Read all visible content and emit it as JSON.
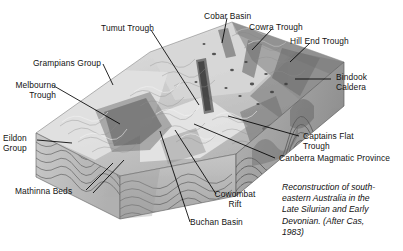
{
  "figure": {
    "caption": "Reconstruction of south-\neastern Australia in the\nLate Silurian and Early\nDevonian. (After Cas,\n1983)",
    "palette": {
      "background": "#ffffff",
      "text": "#131313",
      "leader_line": "#000000",
      "terrain_light": "#e8e8e8",
      "terrain_mid": "#b4b4b4",
      "terrain_dark": "#6e6e6e",
      "terrain_shadow": "#4a4a4a",
      "side_face": "#a9a9a9",
      "front_face": "#bdbdbd",
      "strata_line": "#5a5a5a"
    }
  },
  "labels": [
    {
      "id": "tumut-trough",
      "text": "Tumut Trough"
    },
    {
      "id": "cobar-basin",
      "text": "Cobar Basin"
    },
    {
      "id": "cowra-trough",
      "text": "Cowra Trough"
    },
    {
      "id": "hill-end-trough",
      "text": "Hill End Trough"
    },
    {
      "id": "grampians-group",
      "text": "Grampians Group"
    },
    {
      "id": "melbourne-trough",
      "text": "Melbourne\nTrough"
    },
    {
      "id": "bindook-caldera",
      "text": "Bindook\nCaldera"
    },
    {
      "id": "eildon-group",
      "text": "Eildon\nGroup"
    },
    {
      "id": "captains-flat-trough",
      "text": "Captains Flat\nTrough"
    },
    {
      "id": "canberra-magmatic-province",
      "text": "Canberra Magmatic Province"
    },
    {
      "id": "mathinna-beds",
      "text": "Mathinna Beds"
    },
    {
      "id": "cowombat-rift",
      "text": "Cowombat\nRift"
    },
    {
      "id": "buchan-basin",
      "text": "Buchan Basin"
    }
  ]
}
